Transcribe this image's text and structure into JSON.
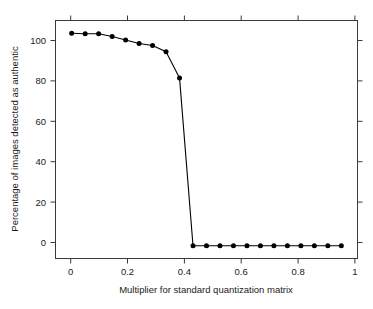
{
  "chart_data": {
    "type": "line",
    "title": "",
    "subtitle": "",
    "xlabel": "Multiplier for standard quantization matrix",
    "ylabel": "Percentage of images detected as authentic",
    "xlim": [
      -0.06,
      1.06
    ],
    "ylim": [
      -6,
      106
    ],
    "xticks": [
      0,
      0.2,
      0.4,
      0.6,
      0.8,
      1
    ],
    "xtick_labels": [
      "0",
      "0.2",
      "0.4",
      "0.6",
      "0.8",
      "1"
    ],
    "yticks": [
      0,
      20,
      40,
      60,
      80,
      100
    ],
    "ytick_labels": [
      "0",
      "20",
      "40",
      "60",
      "80",
      "100"
    ],
    "grid": false,
    "legend": false,
    "legend_position": "none",
    "marker": "filled-circle",
    "line_color": "#000000",
    "marker_color": "#000000",
    "x": [
      0.0,
      0.05,
      0.1,
      0.15,
      0.2,
      0.25,
      0.3,
      0.35,
      0.4,
      0.45,
      0.5,
      0.55,
      0.6,
      0.65,
      0.7,
      0.75,
      0.8,
      0.85,
      0.9,
      0.95,
      1.0
    ],
    "values": [
      100,
      99.8,
      99.8,
      98.5,
      96.8,
      95.2,
      94.2,
      91.3,
      79.0,
      0,
      0,
      0,
      0,
      0,
      0,
      0,
      0,
      0,
      0,
      0,
      0
    ],
    "series": [
      {
        "name": "Percentage detected as authentic",
        "values": [
          100,
          99.8,
          99.8,
          98.5,
          96.8,
          95.2,
          94.2,
          91.3,
          79.0,
          0,
          0,
          0,
          0,
          0,
          0,
          0,
          0,
          0,
          0,
          0,
          0
        ]
      }
    ]
  },
  "figure": {
    "background_color": "#ffffff",
    "axis_color": "#3a3a3a"
  }
}
